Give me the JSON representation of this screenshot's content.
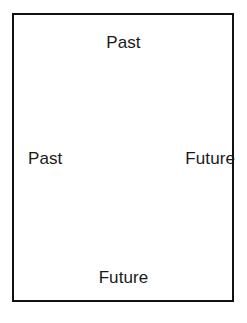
{
  "diagram": {
    "title": "",
    "frame": {
      "border_color": "#111111",
      "fill_color": "#ffffff",
      "border_width_px": 2.5
    },
    "background_color": "#ffffff",
    "text_color": "#1a1a1a",
    "labels": [
      {
        "id": "top",
        "text": "Past",
        "position": "top-center"
      },
      {
        "id": "left",
        "text": "Past",
        "position": "middle-left"
      },
      {
        "id": "right",
        "text": "Future",
        "position": "middle-right"
      },
      {
        "id": "bottom",
        "text": "Future",
        "position": "bottom-center"
      }
    ]
  }
}
